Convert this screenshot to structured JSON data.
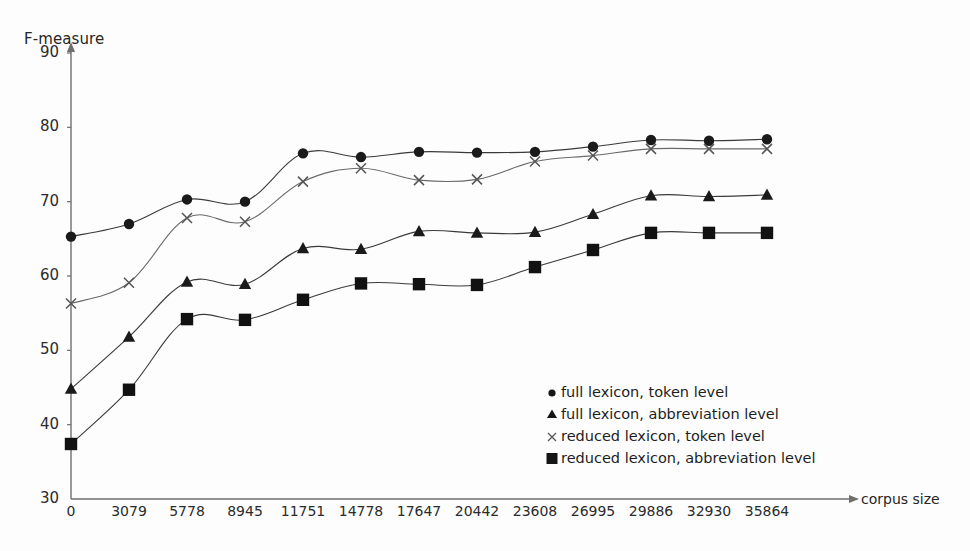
{
  "chart_data": {
    "type": "line",
    "title": "",
    "xlabel": "corpus size",
    "ylabel": "F-measure",
    "ylim": [
      30,
      90
    ],
    "yticks": [
      30,
      40,
      50,
      60,
      70,
      80,
      90
    ],
    "grid": false,
    "legend_position": "inside-lower-right",
    "categories": [
      "0",
      "3079",
      "5778",
      "8945",
      "11751",
      "14778",
      "17647",
      "20442",
      "23608",
      "26995",
      "29886",
      "32930",
      "35864"
    ],
    "x": [
      0,
      3079,
      5778,
      8945,
      11751,
      14778,
      17647,
      20442,
      23608,
      26995,
      29886,
      32930,
      35864
    ],
    "series": [
      {
        "name": "full lexicon, token level",
        "marker": "circle",
        "color": "#1a1a1a",
        "values": [
          65.3,
          67.0,
          70.3,
          70.0,
          76.5,
          76.0,
          76.7,
          76.6,
          76.7,
          77.4,
          78.3,
          78.2,
          78.4
        ]
      },
      {
        "name": "full lexicon, abbreviation level",
        "marker": "triangle",
        "color": "#1a1a1a",
        "values": [
          44.8,
          51.8,
          59.2,
          58.9,
          63.7,
          63.6,
          66.0,
          65.8,
          65.9,
          68.3,
          70.8,
          70.7,
          70.9
        ]
      },
      {
        "name": "reduced lexicon, token level",
        "marker": "cross",
        "color": "#555555",
        "values": [
          56.3,
          59.1,
          67.8,
          67.3,
          72.7,
          74.5,
          72.9,
          73.0,
          75.4,
          76.2,
          77.1,
          77.1,
          77.1
        ]
      },
      {
        "name": "reduced lexicon, abbreviation level",
        "marker": "square",
        "color": "#111111",
        "values": [
          37.4,
          44.7,
          54.2,
          54.1,
          56.8,
          59.0,
          58.9,
          58.8,
          61.2,
          63.5,
          65.8,
          65.8,
          65.8
        ]
      }
    ]
  },
  "axes": {
    "y_title": "F-measure",
    "x_title": "corpus size"
  },
  "legend": {
    "entries": [
      {
        "marker": "circle",
        "label": "full lexicon, token level"
      },
      {
        "marker": "triangle",
        "label": "full lexicon, abbreviation level"
      },
      {
        "marker": "cross",
        "label": "reduced lexicon, token level"
      },
      {
        "marker": "square",
        "label": "reduced lexicon, abbreviation level"
      }
    ]
  }
}
